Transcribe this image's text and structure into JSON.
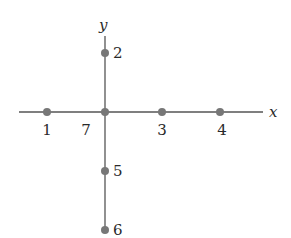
{
  "diagram": {
    "type": "coordinate-axes-with-labeled-points",
    "colors": {
      "axis": "#555555",
      "point": "#777777",
      "text": "#2a2a2a"
    },
    "axes": {
      "x": {
        "label": "x",
        "x1": 19,
        "x2": 263,
        "y": 112
      },
      "y": {
        "label": "y",
        "y1": 36,
        "y2": 230,
        "x": 105
      }
    },
    "points": [
      {
        "id": "1",
        "label": "1",
        "cx": 47,
        "cy": 112,
        "lx": 47,
        "ly": 135,
        "anchor": "middle"
      },
      {
        "id": "2",
        "label": "2",
        "cx": 105,
        "cy": 53,
        "lx": 113,
        "ly": 58,
        "anchor": "start"
      },
      {
        "id": "3",
        "label": "3",
        "cx": 162,
        "cy": 112,
        "lx": 162,
        "ly": 135,
        "anchor": "middle"
      },
      {
        "id": "4",
        "label": "4",
        "cx": 220,
        "cy": 112,
        "lx": 222,
        "ly": 135,
        "anchor": "middle"
      },
      {
        "id": "5",
        "label": "5",
        "cx": 105,
        "cy": 171,
        "lx": 113,
        "ly": 176,
        "anchor": "start"
      },
      {
        "id": "6",
        "label": "6",
        "cx": 105,
        "cy": 230,
        "lx": 113,
        "ly": 235,
        "anchor": "start"
      },
      {
        "id": "7",
        "label": "7",
        "cx": 105,
        "cy": 112,
        "lx": 86,
        "ly": 135,
        "anchor": "middle"
      }
    ]
  }
}
